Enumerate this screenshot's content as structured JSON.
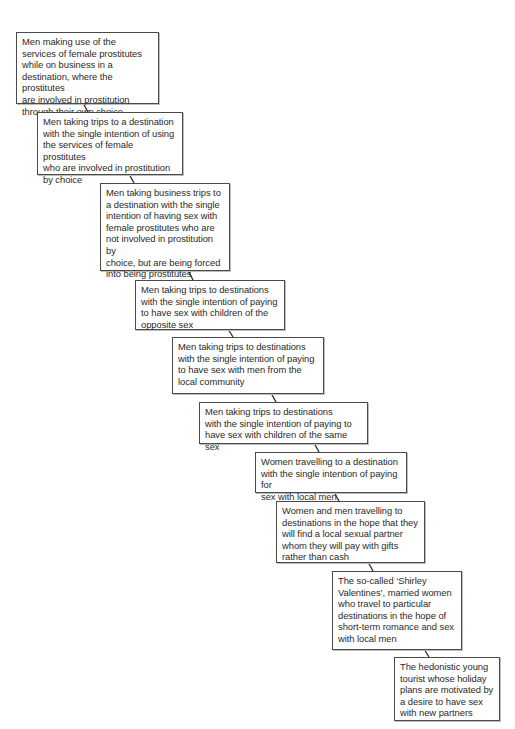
{
  "diagram": {
    "type": "staircase-continuum",
    "boxes": [
      {
        "id": 1,
        "text": "Men making use of the\nservices of female prostitutes\nwhile on business in a\ndestination, where the prostitutes\nare involved in prostitution\nthrough their own choice"
      },
      {
        "id": 2,
        "text": "Men taking trips to a destination\nwith the single intention of using\nthe services of female prostitutes\nwho are involved in prostitution\nby choice"
      },
      {
        "id": 3,
        "text": "Men taking business trips to\na destination with the single\nintention of having sex with\nfemale prostitutes who are\nnot involved in prostitution by\nchoice, but are being forced\ninto being prostitutes"
      },
      {
        "id": 4,
        "text": "Men taking trips to destinations\nwith the single intention of paying\nto have sex with children of the\nopposite sex"
      },
      {
        "id": 5,
        "text": "Men taking trips to destinations\nwith the single intention of paying\nto have sex with men from the\nlocal community"
      },
      {
        "id": 6,
        "text": "Men taking trips to destinations\nwith the single intention of paying to\nhave sex with children of the same sex"
      },
      {
        "id": 7,
        "text": "Women travelling to a destination\nwith the single intention of paying for\nsex with local men"
      },
      {
        "id": 8,
        "text": "Women and men travelling to\ndestinations in the hope that they\nwill find a local sexual partner\nwhom they will pay with gifts\nrather than cash"
      },
      {
        "id": 9,
        "text": "The so-called ‘Shirley\nValentines’, married women\nwho travel to particular\ndestinations in the hope of\nshort-term romance and sex\nwith local men"
      },
      {
        "id": 10,
        "text": "The hedonistic young\ntourist whose holiday\nplans are motivated by\na desire to have sex\nwith new partners"
      }
    ],
    "colors": {
      "border": "#4a4a4a",
      "text": "#2a2a2a",
      "connector": "#333333",
      "background": "#ffffff"
    }
  }
}
